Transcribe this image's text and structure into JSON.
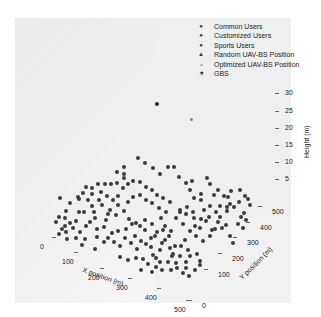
{
  "chart_data": {
    "type": "scatter",
    "projection": "3d",
    "title": "",
    "xlabel": "X position (m)",
    "ylabel": "Y position (m)",
    "zlabel": "Height (m)",
    "x_ticks": [
      "0",
      "100",
      "200",
      "300",
      "400",
      "500"
    ],
    "y_ticks": [
      "0",
      "100",
      "200",
      "300",
      "400",
      "500"
    ],
    "z_ticks": [
      "5",
      "10",
      "15",
      "20",
      "25",
      "30"
    ],
    "xlim": [
      0,
      500
    ],
    "ylim": [
      0,
      500
    ],
    "zlim": [
      0,
      30
    ],
    "grid": false,
    "legend_position": "upper right",
    "legend": [
      {
        "label": "Common Users",
        "marker": "●"
      },
      {
        "label": "Customized Users",
        "marker": "●"
      },
      {
        "label": "Sports Users",
        "marker": "●"
      },
      {
        "label": "Random UAV-BS Position",
        "marker": "▲"
      },
      {
        "label": "Optimized UAV-BS Position",
        "marker": "▴"
      },
      {
        "label": "GBS",
        "marker": "★"
      }
    ],
    "series": [
      {
        "name": "Users (ground, z=0)",
        "note": "~200 user points scattered over 500x500 m area at ground level",
        "screen_points": [
          [
            138,
            158
          ],
          [
            145,
            163
          ],
          [
            124,
            167
          ],
          [
            124,
            174
          ],
          [
            124,
            178
          ],
          [
            117,
            172
          ],
          [
            153,
            168
          ],
          [
            168,
            167
          ],
          [
            174,
            167
          ],
          [
            160,
            174
          ],
          [
            179,
            177
          ],
          [
            186,
            183
          ],
          [
            192,
            181
          ],
          [
            190,
            190
          ],
          [
            207,
            178
          ],
          [
            210,
            184
          ],
          [
            201,
            194
          ],
          [
            218,
            190
          ],
          [
            214,
            195
          ],
          [
            224,
            196
          ],
          [
            231,
            191
          ],
          [
            228,
            197
          ],
          [
            201,
            200
          ],
          [
            194,
            198
          ],
          [
            240,
            190
          ],
          [
            227,
            207
          ],
          [
            210,
            206
          ],
          [
            204,
            210
          ],
          [
            193,
            212
          ],
          [
            187,
            207
          ],
          [
            180,
            210
          ],
          [
            166,
            212
          ],
          [
            159,
            208
          ],
          [
            152,
            203
          ],
          [
            146,
            200
          ],
          [
            140,
            195
          ],
          [
            133,
            197
          ],
          [
            128,
            202
          ],
          [
            118,
            205
          ],
          [
            110,
            210
          ],
          [
            108,
            214
          ],
          [
            99,
            200
          ],
          [
            92,
            194
          ],
          [
            88,
            200
          ],
          [
            83,
            193
          ],
          [
            78,
            197
          ],
          [
            98,
            184
          ],
          [
            105,
            184
          ],
          [
            111,
            184
          ],
          [
            117,
            183
          ],
          [
            92,
            188
          ],
          [
            86,
            187
          ],
          [
            79,
            199
          ],
          [
            70,
            203
          ],
          [
            60,
            198
          ],
          [
            66,
            211
          ],
          [
            65,
            218
          ],
          [
            65,
            226
          ],
          [
            56,
            222
          ],
          [
            59,
            217
          ],
          [
            79,
            212
          ],
          [
            84,
            212
          ],
          [
            94,
            212
          ],
          [
            106,
            220
          ],
          [
            116,
            215
          ],
          [
            124,
            211
          ],
          [
            129,
            219
          ],
          [
            132,
            224
          ],
          [
            140,
            226
          ],
          [
            145,
            220
          ],
          [
            152,
            224
          ],
          [
            161,
            218
          ],
          [
            165,
            226
          ],
          [
            171,
            231
          ],
          [
            176,
            218
          ],
          [
            180,
            212
          ],
          [
            186,
            214
          ],
          [
            194,
            218
          ],
          [
            201,
            219
          ],
          [
            209,
            217
          ],
          [
            216,
            212
          ],
          [
            220,
            206
          ],
          [
            227,
            211
          ],
          [
            234,
            207
          ],
          [
            241,
            217
          ],
          [
            238,
            224
          ],
          [
            226,
            225
          ],
          [
            215,
            229
          ],
          [
            210,
            236
          ],
          [
            203,
            241
          ],
          [
            196,
            236
          ],
          [
            190,
            231
          ],
          [
            185,
            240
          ],
          [
            181,
            246
          ],
          [
            188,
            250
          ],
          [
            190,
            256
          ],
          [
            197,
            254
          ],
          [
            200,
            261
          ],
          [
            186,
            262
          ],
          [
            180,
            256
          ],
          [
            173,
            254
          ],
          [
            175,
            246
          ],
          [
            165,
            240
          ],
          [
            160,
            250
          ],
          [
            153,
            255
          ],
          [
            148,
            264
          ],
          [
            143,
            259
          ],
          [
            137,
            249
          ],
          [
            131,
            243
          ],
          [
            125,
            238
          ],
          [
            120,
            246
          ],
          [
            114,
            242
          ],
          [
            108,
            238
          ],
          [
            104,
            242
          ],
          [
            97,
            237
          ],
          [
            85,
            239
          ],
          [
            76,
            238
          ],
          [
            67,
            239
          ],
          [
            59,
            234
          ],
          [
            66,
            232
          ],
          [
            76,
            221
          ],
          [
            90,
            222
          ],
          [
            97,
            229
          ],
          [
            104,
            227
          ],
          [
            112,
            233
          ],
          [
            118,
            231
          ],
          [
            126,
            229
          ],
          [
            135,
            236
          ],
          [
            141,
            241
          ],
          [
            151,
            238
          ],
          [
            157,
            232
          ],
          [
            163,
            230
          ],
          [
            169,
            236
          ],
          [
            172,
            256
          ],
          [
            168,
            262
          ],
          [
            160,
            262
          ],
          [
            156,
            258
          ],
          [
            151,
            247
          ],
          [
            146,
            244
          ],
          [
            206,
            221
          ],
          [
            218,
            222
          ],
          [
            222,
            228
          ],
          [
            230,
            236
          ],
          [
            233,
            243
          ],
          [
            243,
            228
          ],
          [
            246,
            220
          ],
          [
            244,
            213
          ],
          [
            248,
            199
          ],
          [
            250,
            205
          ],
          [
            239,
            202
          ],
          [
            245,
            196
          ],
          [
            230,
            204
          ],
          [
            220,
            217
          ],
          [
            212,
            230
          ],
          [
            200,
            228
          ],
          [
            195,
            226
          ],
          [
            183,
            224
          ],
          [
            170,
            202
          ],
          [
            163,
            198
          ],
          [
            157,
            195
          ],
          [
            152,
            190
          ],
          [
            146,
            187
          ],
          [
            140,
            182
          ],
          [
            133,
            181
          ],
          [
            128,
            184
          ],
          [
            123,
            188
          ],
          [
            118,
            196
          ],
          [
            113,
            200
          ],
          [
            107,
            196
          ],
          [
            101,
            192
          ],
          [
            92,
            206
          ],
          [
            102,
            205
          ],
          [
            95,
            218
          ],
          [
            86,
            226
          ],
          [
            80,
            232
          ],
          [
            73,
            228
          ],
          [
            70,
            223
          ],
          [
            62,
            229
          ],
          [
            82,
            245
          ],
          [
            95,
            249
          ],
          [
            120,
            257
          ],
          [
            128,
            260
          ],
          [
            136,
            258
          ],
          [
            141,
            270
          ],
          [
            152,
            272
          ],
          [
            156,
            267
          ],
          [
            162,
            270
          ],
          [
            171,
            270
          ],
          [
            177,
            268
          ],
          [
            183,
            273
          ],
          [
            189,
            276
          ],
          [
            176,
            263
          ],
          [
            170,
            248
          ],
          [
            162,
            243
          ],
          [
            155,
            236
          ],
          [
            145,
            230
          ],
          [
            136,
            223
          ],
          [
            200,
            265
          ],
          [
            195,
            270
          ],
          [
            186,
            268
          ]
        ]
      },
      {
        "name": "Random UAV-BS Position",
        "screen_points": [
          [
            157,
            104
          ]
        ]
      },
      {
        "name": "Optimized UAV-BS Position",
        "screen_points": [
          [
            192,
            120
          ]
        ]
      }
    ]
  },
  "x_tick_positions": [
    [
      40,
      247
    ],
    [
      62,
      262
    ],
    [
      88,
      278
    ],
    [
      116,
      288
    ],
    [
      145,
      298
    ],
    [
      174,
      310
    ]
  ],
  "y_tick_positions": [
    [
      202,
      306
    ],
    [
      218,
      275
    ],
    [
      232,
      259
    ],
    [
      247,
      243
    ],
    [
      260,
      228
    ],
    [
      272,
      212
    ]
  ],
  "z_tick_positions": [
    [
      285,
      179
    ],
    [
      285,
      162
    ],
    [
      285,
      145
    ],
    [
      285,
      128
    ],
    [
      285,
      111
    ],
    [
      285,
      93
    ]
  ]
}
